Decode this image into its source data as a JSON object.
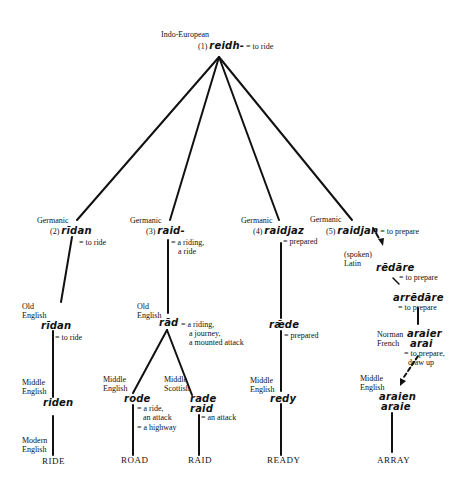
{
  "diagram": {
    "type": "etymology-tree",
    "root": {
      "language": "Indo-European",
      "number": "(1)",
      "form": "reidh-",
      "gloss": "= to ride"
    },
    "branches": [
      {
        "id": "ride",
        "germanic": {
          "language": "Germanic",
          "number": "(2)",
          "form": "rīdan",
          "gloss": "= to ride"
        },
        "old_english": {
          "language_line1": "Old",
          "language_line2": "English",
          "form": "rīdan",
          "gloss": "= to ride"
        },
        "middle_english": {
          "language_line1": "Middle",
          "language_line2": "English",
          "form": "riden"
        },
        "modern": {
          "language_line1": "Modern",
          "language_line2": "English",
          "word": "RIDE"
        }
      },
      {
        "id": "road-raid",
        "germanic": {
          "language": "Germanic",
          "number": "(3)",
          "form": "raid-",
          "gloss_line1": "= a riding,",
          "gloss_line2": "a ride"
        },
        "old_english": {
          "language_line1": "Old",
          "language_line2": "English",
          "form": "rād",
          "gloss_line1": "= a riding,",
          "gloss_line2": "a journey,",
          "gloss_line3": "a mounted attack"
        },
        "sub": [
          {
            "language_line1": "Middle",
            "language_line2": "English",
            "form": "rode",
            "gloss_line1": "= a ride,",
            "gloss_line2": "an attack",
            "gloss_line3": "= a highway",
            "modern": "ROAD"
          },
          {
            "language_line1": "Middle",
            "language_line2": "Scottish",
            "form_line1": "rade",
            "form_line2": "raid",
            "gloss": "= an attack",
            "modern": "RAID"
          }
        ]
      },
      {
        "id": "ready",
        "germanic": {
          "language": "Germanic",
          "number": "(4)",
          "form": "raidjaz",
          "gloss": "= prepared"
        },
        "old_english": {
          "form": "rǣde",
          "gloss": "= prepared"
        },
        "middle_english": {
          "language_line1": "Middle",
          "language_line2": "English",
          "form": "redy"
        },
        "modern": "READY"
      },
      {
        "id": "array",
        "germanic": {
          "language": "Germanic",
          "number": "(5)",
          "form": "raidjan",
          "gloss": "= to prepare"
        },
        "latin": {
          "language_line1": "(spoken)",
          "language_line2": "Latin",
          "form": "rēdāre",
          "gloss": "= to prepare"
        },
        "latin2": {
          "form": "arrēdāre",
          "gloss": "= to prepare"
        },
        "norman_french": {
          "language_line1": "Norman",
          "language_line2": "French",
          "form_line1": "araier",
          "form_line2": "arai",
          "gloss_line1": "= to prepare,",
          "gloss_line2": "draw up"
        },
        "middle_english": {
          "language_line1": "Middle",
          "language_line2": "English",
          "form_line1": "araien",
          "form_line2": "araie"
        },
        "modern": "ARRAY"
      }
    ]
  },
  "colors": {
    "ink": "#111111",
    "background": "#ffffff"
  }
}
